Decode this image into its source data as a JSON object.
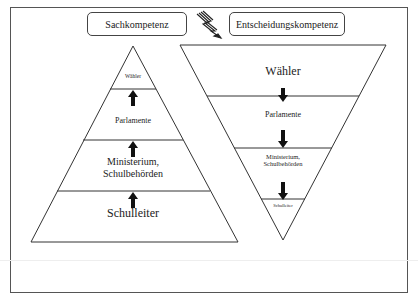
{
  "header": {
    "left_label": "Sachkompetenz",
    "right_label": "Entscheidungskompetenz",
    "conflict_icon": "lightning-bolt-icon"
  },
  "pyramid_left": {
    "direction": "bottom-up",
    "layers": [
      {
        "label": "Wähler"
      },
      {
        "label": "Parlamente"
      },
      {
        "label": "Ministerium, Schulbehörden",
        "line1": "Ministerium,",
        "line2": "Schulbehörden"
      },
      {
        "label": "Schulleiter"
      }
    ],
    "arrow_icon": "arrow-up-icon"
  },
  "pyramid_right": {
    "direction": "top-down",
    "layers": [
      {
        "label": "Wähler"
      },
      {
        "label": "Parlamente"
      },
      {
        "label": "Ministerium, Schulbehörden",
        "line1": "Ministerium,",
        "line2": "Schulbehörden"
      },
      {
        "label": "Schulleiter"
      }
    ],
    "arrow_icon": "arrow-down-icon"
  }
}
